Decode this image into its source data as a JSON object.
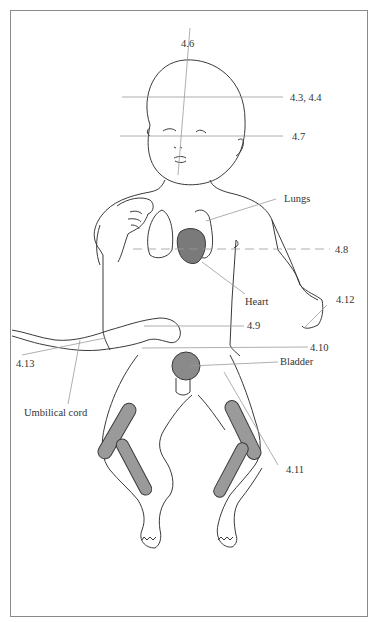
{
  "diagram": {
    "colors": {
      "outline": "#3a3a3a",
      "leader_line": "#9a9a9a",
      "organ_fill": "#7a7a7a",
      "bone_fill": "#9a9a9a",
      "frame": "#8a8a8a",
      "background": "#ffffff"
    },
    "labels": {
      "l46": "4.6",
      "l43_44": "4.3, 4.4",
      "l47": "4.7",
      "lungs": "Lungs",
      "l48": "4.8",
      "heart": "Heart",
      "l412": "4.12",
      "l49": "4.9",
      "l410": "4.10",
      "l413": "4.13",
      "bladder": "Bladder",
      "umbilical_cord": "Umbilical cord",
      "l411": "4.11"
    }
  }
}
